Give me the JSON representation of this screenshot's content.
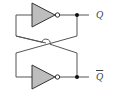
{
  "diagram": {
    "type": "cross-coupled inverter latch",
    "colors": {
      "wire": "#555555",
      "gate_fill": "#bdbdbd",
      "gate_stroke": "#333333",
      "node": "#111111",
      "label": "#444444"
    },
    "outputs": [
      {
        "label": "Q",
        "name": "q-output"
      },
      {
        "label": "Q",
        "name": "q-bar-output",
        "overline": true
      }
    ],
    "gates": [
      {
        "kind": "inverter",
        "position": "top"
      },
      {
        "kind": "inverter",
        "position": "bottom"
      }
    ]
  }
}
